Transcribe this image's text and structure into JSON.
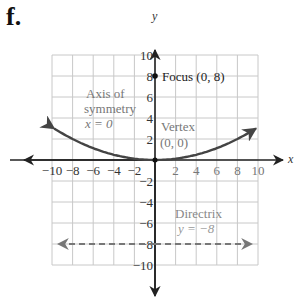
{
  "figure_label": "f.",
  "chart_data": {
    "type": "line",
    "title": "",
    "xlabel": "x",
    "ylabel": "y",
    "xlim": [
      -10,
      10
    ],
    "ylim": [
      -10,
      10
    ],
    "grid": true,
    "grid_step": 2,
    "x_ticks": [
      "-10",
      "-8",
      "-6",
      "-4",
      "-2",
      "2",
      "4",
      "6",
      "8",
      "10"
    ],
    "y_ticks": [
      "10",
      "8",
      "6",
      "4",
      "2",
      "-2",
      "-4",
      "-6",
      "-8",
      "-10"
    ],
    "series": [
      {
        "name": "Parabola x^2 = 32y",
        "equation": "y = x^2 / 32",
        "x": [
          -10,
          -8,
          -6,
          -4,
          -2,
          0,
          2,
          4,
          6,
          8,
          10
        ],
        "y": [
          3.125,
          2,
          1.125,
          0.5,
          0.125,
          0,
          0.125,
          0.5,
          1.125,
          2,
          3.125
        ],
        "style": "solid",
        "color": "#444444"
      },
      {
        "name": "Directrix",
        "equation": "y = -8",
        "x": [
          -10,
          10
        ],
        "y": [
          -8,
          -8
        ],
        "style": "dashed",
        "color": "#777777"
      }
    ],
    "points": [
      {
        "name": "Focus",
        "x": 0,
        "y": 8
      },
      {
        "name": "Vertex",
        "x": 0,
        "y": 0
      }
    ],
    "annotations": [
      {
        "text_lines": [
          "Focus (0, 8)"
        ],
        "at": [
          0.6,
          8
        ]
      },
      {
        "text_lines": [
          "Axis of",
          "symmetry",
          "x = 0"
        ],
        "at": [
          -6.7,
          5.6
        ]
      },
      {
        "text_lines": [
          "Vertex",
          "(0, 0)"
        ],
        "at": [
          2,
          3.3
        ]
      },
      {
        "text_lines": [
          "Directrix",
          "y = −8"
        ],
        "at": [
          3.8,
          -4.6
        ]
      }
    ]
  },
  "annotations_text": {
    "focus": "Focus (0, 8)",
    "axis_line1": "Axis of",
    "axis_line2": "symmetry",
    "axis_line3": "x = 0",
    "vertex_line1": "Vertex",
    "vertex_line2": "(0, 0)",
    "directrix_line1": "Directrix",
    "directrix_line2": "y = −8"
  },
  "axes": {
    "x_label": "x",
    "y_label": "y"
  },
  "colors": {
    "grid": "#c8c8c8",
    "axis": "#222222",
    "curve": "#444444",
    "directrix": "#777777",
    "label_gray": "#888888"
  }
}
